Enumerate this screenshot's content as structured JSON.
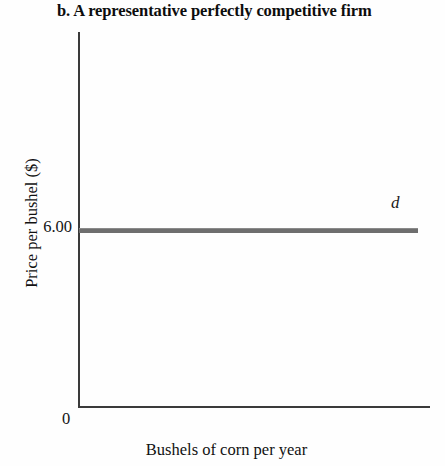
{
  "chart_data": {
    "type": "line",
    "title": "b. A representative perfectly competitive firm",
    "xlabel": "Bushels of corn per year",
    "ylabel": "Price per bushel ($)",
    "origin_label": "0",
    "grid": false,
    "legend_position": "inline-right",
    "ytick_labels": [
      "6.00"
    ],
    "ytick_values": [
      6.0
    ],
    "xtick_labels": [],
    "ylim": [
      0,
      12
    ],
    "xlim": [
      0,
      10
    ],
    "series": [
      {
        "name": "d",
        "label": "d",
        "style": "horizontal-line",
        "color": "#6e6e6e",
        "thickness_px": 5,
        "x": [
          0,
          10
        ],
        "values": [
          6.0,
          6.0
        ]
      }
    ],
    "annotations": [
      {
        "text": "d",
        "x": 9.6,
        "y": 6.9,
        "italic": true
      }
    ]
  },
  "colors": {
    "background": "#fefefe",
    "axis": "#3a3a3a",
    "demand_line": "#6e6e6e",
    "text": "#111111"
  }
}
